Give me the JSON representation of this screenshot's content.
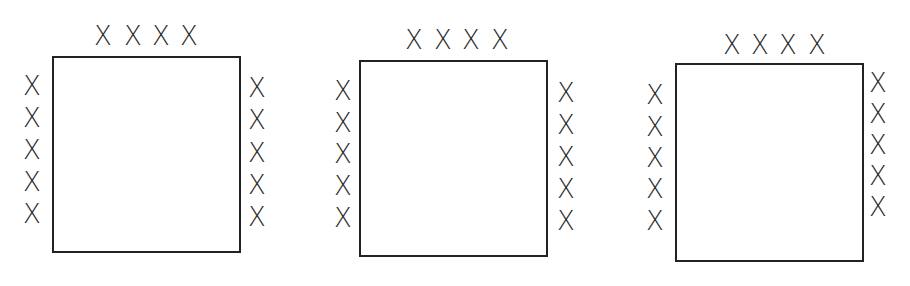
{
  "diagram": {
    "mark_symbol": "X",
    "line_color": "#222222",
    "background": "#ffffff",
    "panels": [
      {
        "id": "panel-1",
        "square": {
          "x": 52,
          "y": 56,
          "w": 189,
          "h": 197
        },
        "top_marks": [
          {
            "x": 103,
            "y": 36
          },
          {
            "x": 133,
            "y": 36
          },
          {
            "x": 161,
            "y": 36
          },
          {
            "x": 189,
            "y": 36
          }
        ],
        "left_marks": [
          {
            "x": 32,
            "y": 86
          },
          {
            "x": 32,
            "y": 118
          },
          {
            "x": 32,
            "y": 150
          },
          {
            "x": 32,
            "y": 182
          },
          {
            "x": 32,
            "y": 214
          }
        ],
        "right_marks": [
          {
            "x": 257,
            "y": 88
          },
          {
            "x": 257,
            "y": 120
          },
          {
            "x": 257,
            "y": 153
          },
          {
            "x": 257,
            "y": 185
          },
          {
            "x": 257,
            "y": 217
          }
        ]
      },
      {
        "id": "panel-2",
        "square": {
          "x": 359,
          "y": 60,
          "w": 189,
          "h": 197
        },
        "top_marks": [
          {
            "x": 414,
            "y": 40
          },
          {
            "x": 443,
            "y": 40
          },
          {
            "x": 471,
            "y": 40
          },
          {
            "x": 500,
            "y": 40
          }
        ],
        "left_marks": [
          {
            "x": 343,
            "y": 91
          },
          {
            "x": 343,
            "y": 123
          },
          {
            "x": 343,
            "y": 154
          },
          {
            "x": 343,
            "y": 186
          },
          {
            "x": 343,
            "y": 218
          }
        ],
        "right_marks": [
          {
            "x": 566,
            "y": 93
          },
          {
            "x": 566,
            "y": 125
          },
          {
            "x": 566,
            "y": 157
          },
          {
            "x": 566,
            "y": 189
          },
          {
            "x": 566,
            "y": 221
          }
        ]
      },
      {
        "id": "panel-3",
        "square": {
          "x": 675,
          "y": 63,
          "w": 189,
          "h": 199
        },
        "top_marks": [
          {
            "x": 732,
            "y": 45
          },
          {
            "x": 760,
            "y": 45
          },
          {
            "x": 788,
            "y": 45
          },
          {
            "x": 817,
            "y": 45
          }
        ],
        "left_marks": [
          {
            "x": 655,
            "y": 95
          },
          {
            "x": 655,
            "y": 127
          },
          {
            "x": 655,
            "y": 158
          },
          {
            "x": 655,
            "y": 189
          },
          {
            "x": 655,
            "y": 221
          }
        ],
        "right_marks": [
          {
            "x": 878,
            "y": 83
          },
          {
            "x": 878,
            "y": 114
          },
          {
            "x": 878,
            "y": 145
          },
          {
            "x": 878,
            "y": 176
          },
          {
            "x": 878,
            "y": 207
          }
        ]
      }
    ]
  }
}
